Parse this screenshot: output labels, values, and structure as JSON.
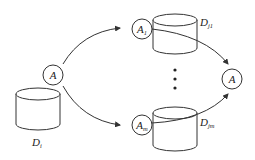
{
  "diagram": {
    "nodes": {
      "source_agent": {
        "label": "A"
      },
      "agent_1": {
        "label": "A",
        "sub": "1"
      },
      "agent_m": {
        "label": "A",
        "sub": "m"
      },
      "target_agent": {
        "label": "A"
      }
    },
    "databases": {
      "source_db": {
        "label": "D",
        "sub": "i"
      },
      "db_j1": {
        "label": "D",
        "sub": "j1"
      },
      "db_jm": {
        "label": "D",
        "sub": "jm"
      }
    },
    "ellipsis": "⋮",
    "colors": {
      "stroke": "#333333",
      "background": "#ffffff"
    }
  }
}
